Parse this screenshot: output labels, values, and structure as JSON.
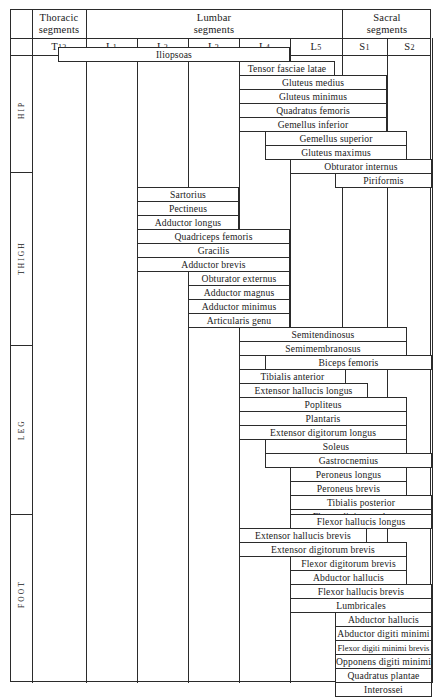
{
  "table": {
    "column_groups": [
      {
        "label": "Thoracic segments",
        "x": 31,
        "w": 54
      },
      {
        "label": "Lumbar segments",
        "x": 85,
        "w": 256
      },
      {
        "label": "Sacral segments",
        "x": 341,
        "w": 90
      }
    ],
    "segments": [
      {
        "label": "T12",
        "base": "T",
        "sub": "12",
        "x": 31,
        "w": 54
      },
      {
        "label": "L1",
        "base": "L",
        "sub": "1",
        "x": 85,
        "w": 51
      },
      {
        "label": "L2",
        "base": "L",
        "sub": "2",
        "x": 136,
        "w": 51
      },
      {
        "label": "L3",
        "base": "L",
        "sub": "3",
        "x": 187,
        "w": 51
      },
      {
        "label": "L4",
        "base": "L",
        "sub": "4",
        "x": 238,
        "w": 51
      },
      {
        "label": "L5",
        "base": "L",
        "sub": "5",
        "x": 289,
        "w": 52
      },
      {
        "label": "S1",
        "base": "S",
        "sub": "1",
        "x": 341,
        "w": 45
      },
      {
        "label": "S2",
        "base": "S",
        "sub": "2",
        "x": 386,
        "w": 45
      }
    ],
    "regions": [
      {
        "label": "HIP",
        "top": 46,
        "height": 125
      },
      {
        "label": "THIGH",
        "top": 171,
        "height": 173
      },
      {
        "label": "LEG",
        "top": 344,
        "height": 169
      },
      {
        "label": "FOOT",
        "top": 513,
        "height": 160
      }
    ]
  },
  "chart_data": {
    "type": "table",
    "xlabel": "Spinal cord segments",
    "ylabel": "Muscles by region",
    "categories": [
      "T12",
      "L1",
      "L2",
      "L3",
      "L4",
      "L5",
      "S1",
      "S2"
    ],
    "regions": [
      "HIP",
      "THIGH",
      "LEG",
      "FOOT"
    ],
    "rows": [
      {
        "muscle": "Iliopsoas",
        "region": "HIP",
        "from": "T12",
        "to": "L4",
        "x": 57,
        "w": 232,
        "y": 46
      },
      {
        "muscle": "Tensor fasciae latae",
        "region": "HIP",
        "from": "L4",
        "to": "L5",
        "x": 238,
        "w": 96,
        "y": 60
      },
      {
        "muscle": "Gluteus medius",
        "region": "HIP",
        "from": "L4",
        "to": "S1",
        "x": 238,
        "w": 148,
        "y": 74
      },
      {
        "muscle": "Gluteus minimus",
        "region": "HIP",
        "from": "L4",
        "to": "S1",
        "x": 238,
        "w": 148,
        "y": 88
      },
      {
        "muscle": "Quadratus femoris",
        "region": "HIP",
        "from": "L4",
        "to": "S1",
        "x": 238,
        "w": 148,
        "y": 102
      },
      {
        "muscle": "Gemellus inferior",
        "region": "HIP",
        "from": "L4",
        "to": "S1",
        "x": 238,
        "w": 148,
        "y": 116
      },
      {
        "muscle": "Gemellus superior",
        "region": "HIP",
        "from": "L5",
        "to": "S2",
        "x": 264,
        "w": 142,
        "y": 130
      },
      {
        "muscle": "Gluteus maximus",
        "region": "HIP",
        "from": "L5",
        "to": "S2",
        "x": 264,
        "w": 142,
        "y": 144
      },
      {
        "muscle": "Obturator internus",
        "region": "HIP",
        "from": "L5",
        "to": "S2",
        "x": 289,
        "w": 142,
        "y": 158
      },
      {
        "muscle": "Piriformis",
        "region": "HIP",
        "from": "S1",
        "to": "S2",
        "x": 334,
        "w": 97,
        "y": 172
      },
      {
        "muscle": "Sartorius",
        "region": "THIGH",
        "from": "L2",
        "to": "L3",
        "x": 136,
        "w": 102,
        "y": 186
      },
      {
        "muscle": "Pectineus",
        "region": "THIGH",
        "from": "L2",
        "to": "L3",
        "x": 136,
        "w": 102,
        "y": 200
      },
      {
        "muscle": "Adductor longus",
        "region": "THIGH",
        "from": "L2",
        "to": "L3",
        "x": 136,
        "w": 102,
        "y": 214
      },
      {
        "muscle": "Quadriceps femoris",
        "region": "THIGH",
        "from": "L2",
        "to": "L4",
        "x": 136,
        "w": 153,
        "y": 228
      },
      {
        "muscle": "Gracilis",
        "region": "THIGH",
        "from": "L2",
        "to": "L4",
        "x": 136,
        "w": 153,
        "y": 242
      },
      {
        "muscle": "Adductor brevis",
        "region": "THIGH",
        "from": "L2",
        "to": "L4",
        "x": 136,
        "w": 153,
        "y": 256
      },
      {
        "muscle": "Obturator externus",
        "region": "THIGH",
        "from": "L3",
        "to": "L4",
        "x": 187,
        "w": 102,
        "y": 270
      },
      {
        "muscle": "Adductor magnus",
        "region": "THIGH",
        "from": "L3",
        "to": "L4",
        "x": 187,
        "w": 102,
        "y": 284
      },
      {
        "muscle": "Adductor minimus",
        "region": "THIGH",
        "from": "L3",
        "to": "L4",
        "x": 187,
        "w": 102,
        "y": 298
      },
      {
        "muscle": "Articularis genu",
        "region": "THIGH",
        "from": "L3",
        "to": "L4",
        "x": 187,
        "w": 102,
        "y": 312
      },
      {
        "muscle": "Semitendinosus",
        "region": "THIGH",
        "from": "L5",
        "to": "S2",
        "x": 238,
        "w": 168,
        "y": 326
      },
      {
        "muscle": "Semimembranosus",
        "region": "THIGH",
        "from": "L5",
        "to": "S2",
        "x": 238,
        "w": 168,
        "y": 340
      },
      {
        "muscle": "Biceps femoris",
        "region": "LEG",
        "from": "L5",
        "to": "S2",
        "x": 264,
        "w": 167,
        "y": 354
      },
      {
        "muscle": "Tibialis anterior",
        "region": "LEG",
        "from": "L4",
        "to": "L5",
        "x": 238,
        "w": 107,
        "y": 368
      },
      {
        "muscle": "Extensor hallucis longus",
        "region": "LEG",
        "from": "L4",
        "to": "S1",
        "x": 238,
        "w": 129,
        "y": 382
      },
      {
        "muscle": "Popliteus",
        "region": "LEG",
        "from": "L4",
        "to": "S2",
        "x": 238,
        "w": 168,
        "y": 396
      },
      {
        "muscle": "Plantaris",
        "region": "LEG",
        "from": "L4",
        "to": "S2",
        "x": 238,
        "w": 168,
        "y": 410
      },
      {
        "muscle": "Extensor digitorum longus",
        "region": "LEG",
        "from": "L4",
        "to": "S2",
        "x": 238,
        "w": 168,
        "y": 424
      },
      {
        "muscle": "Soleus",
        "region": "LEG",
        "from": "L5",
        "to": "S2",
        "x": 264,
        "w": 142,
        "y": 438
      },
      {
        "muscle": "Gastrocnemius",
        "region": "LEG",
        "from": "L5",
        "to": "S2",
        "x": 264,
        "w": 167,
        "y": 452
      },
      {
        "muscle": "Peroneus longus",
        "region": "LEG",
        "from": "L5",
        "to": "S1",
        "x": 289,
        "w": 117,
        "y": 466
      },
      {
        "muscle": "Peroneus brevis",
        "region": "LEG",
        "from": "L5",
        "to": "S1",
        "x": 289,
        "w": 117,
        "y": 480
      },
      {
        "muscle": "Tibialis posterior",
        "region": "LEG",
        "from": "L5",
        "to": "S2",
        "x": 289,
        "w": 142,
        "y": 494
      },
      {
        "muscle": "Flexor digitorum longus",
        "region": "LEG",
        "from": "L5",
        "to": "S2",
        "x": 289,
        "w": 142,
        "y": 508
      },
      {
        "muscle": "Flexor hallucis longus",
        "region": "FOOT",
        "from": "L5",
        "to": "S2",
        "x": 289,
        "w": 142,
        "y": 513
      },
      {
        "muscle": "Extensor hallucis brevis",
        "region": "FOOT",
        "from": "L4",
        "to": "S1",
        "x": 238,
        "w": 128,
        "y": 527
      },
      {
        "muscle": "Extensor digitorum brevis",
        "region": "FOOT",
        "from": "L4",
        "to": "S1",
        "x": 238,
        "w": 168,
        "y": 541
      },
      {
        "muscle": "Flexor digitorum brevis",
        "region": "FOOT",
        "from": "L5",
        "to": "S1",
        "x": 289,
        "w": 117,
        "y": 555
      },
      {
        "muscle": "Abductor hallucis",
        "region": "FOOT",
        "from": "L5",
        "to": "S1",
        "x": 289,
        "w": 117,
        "y": 569
      },
      {
        "muscle": "Flexor hallucis brevis",
        "region": "FOOT",
        "from": "L5",
        "to": "S2",
        "x": 289,
        "w": 142,
        "y": 583
      },
      {
        "muscle": "Lumbricales",
        "region": "FOOT",
        "from": "L5",
        "to": "S2",
        "x": 289,
        "w": 142,
        "y": 597
      },
      {
        "muscle": "Abductor hallucis",
        "region": "FOOT",
        "from": "S1",
        "to": "S2",
        "x": 334,
        "w": 97,
        "y": 611
      },
      {
        "muscle": "Abductor digiti minimi",
        "region": "FOOT",
        "from": "S1",
        "to": "S2",
        "x": 334,
        "w": 97,
        "y": 625
      },
      {
        "muscle": "Flexor digiti minimi brevis",
        "region": "FOOT",
        "from": "S1",
        "to": "S2",
        "x": 334,
        "w": 97,
        "y": 639,
        "tight": true
      },
      {
        "muscle": "Opponens digiti minimi",
        "region": "FOOT",
        "from": "S1",
        "to": "S2",
        "x": 334,
        "w": 97,
        "y": 653
      },
      {
        "muscle": "Quadratus plantae",
        "region": "FOOT",
        "from": "S1",
        "to": "S2",
        "x": 334,
        "w": 97,
        "y": 667
      },
      {
        "muscle": "Interossei",
        "region": "FOOT",
        "from": "S1",
        "to": "S2",
        "x": 334,
        "w": 97,
        "y": 681
      }
    ]
  }
}
